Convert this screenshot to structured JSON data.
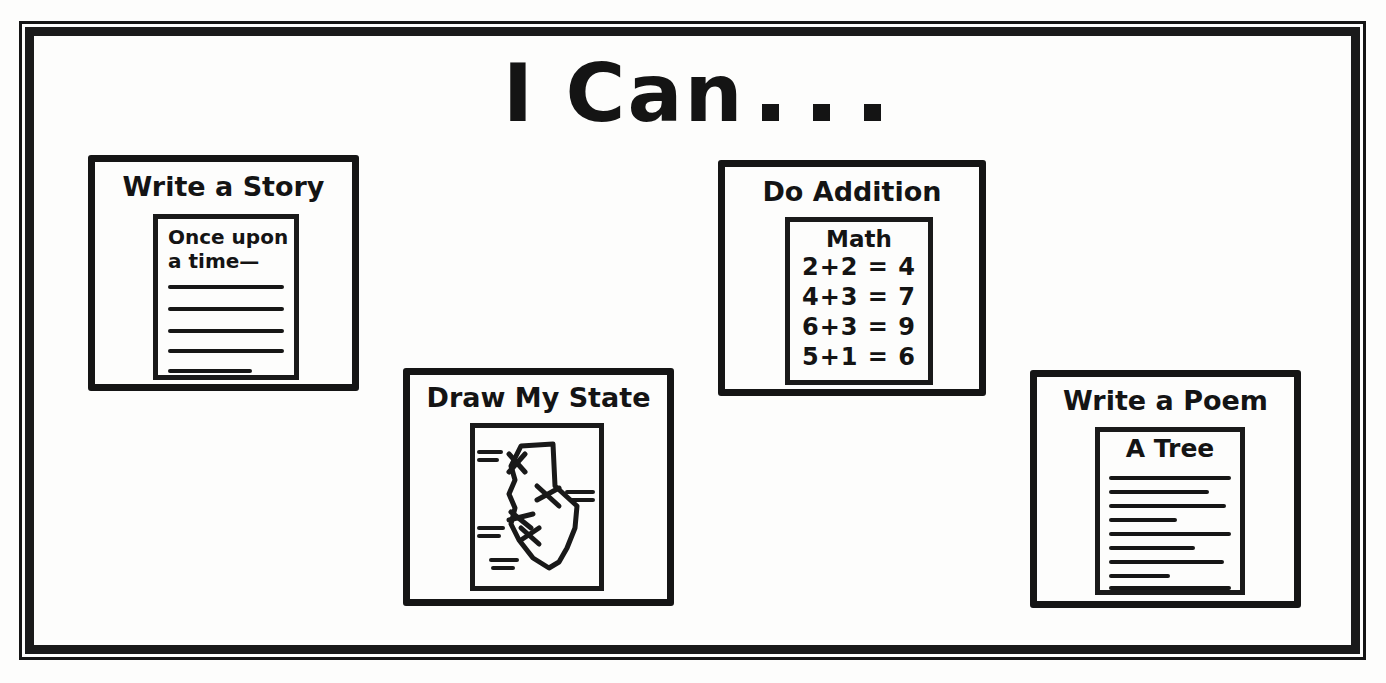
{
  "page": {
    "background_color": "#fdfdfc",
    "ink_color": "#151515",
    "style": "hand-lettered black marker worksheet"
  },
  "title": {
    "text": "I Can",
    "dots": [
      "dot",
      "dot",
      "dot"
    ],
    "full_text": "I Can . . ."
  },
  "panels": [
    {
      "id": "write-a-story",
      "title": "Write a Story",
      "sheet": {
        "kind": "lined-paper",
        "text_lines": [
          "Once upon",
          "a time—"
        ],
        "rule_count": 5,
        "rule_widths": [
          "100%",
          "100%",
          "100%",
          "100%",
          "72%"
        ]
      }
    },
    {
      "id": "do-addition",
      "title": "Do Addition",
      "sheet": {
        "kind": "math-worksheet",
        "heading": "Math",
        "problems": [
          "2+2 = 4",
          "4+3 = 7",
          "6+3 = 9",
          "5+1 = 6"
        ]
      }
    },
    {
      "id": "draw-my-state",
      "title": "Draw My State",
      "sheet": {
        "kind": "state-map-drawing",
        "shape": "california-like state outline",
        "marker_count": 4,
        "x_mark_count": 4
      }
    },
    {
      "id": "write-a-poem",
      "title": "Write a Poem",
      "sheet": {
        "kind": "poem-paper",
        "heading": "A Tree",
        "rule_count": 9,
        "rule_widths": [
          "100%",
          "82%",
          "96%",
          "56%",
          "100%",
          "70%",
          "94%",
          "50%",
          "100%"
        ]
      }
    }
  ]
}
